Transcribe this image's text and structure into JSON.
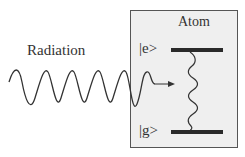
{
  "diagram": {
    "radiation_label": "Radiation",
    "atom_label": "Atom",
    "excited_state_label": "|e>",
    "ground_state_label": "|g>",
    "colors": {
      "box_fill": "#efefef",
      "box_stroke": "#555555",
      "line": "#333333",
      "level_bar": "#2a2a2a"
    }
  }
}
